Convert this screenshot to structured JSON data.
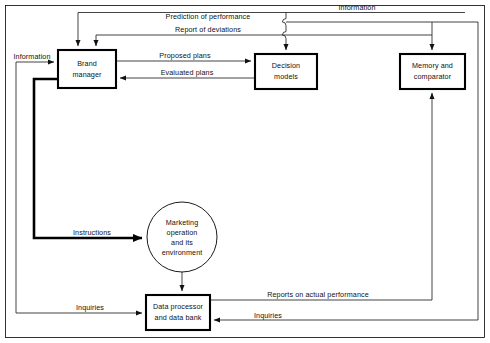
{
  "diagram": {
    "background_color": "#ffffff",
    "line_color": "#222222",
    "nodes": [
      {
        "id": "brand-manager",
        "label_line1": "Brand",
        "label_line2": "manager",
        "shape": "rect",
        "x": 58,
        "y": 50,
        "w": 58,
        "h": 38
      },
      {
        "id": "decision-models",
        "label_line1": "Decision",
        "label_line2": "models",
        "shape": "rect",
        "x": 255,
        "y": 54,
        "w": 62,
        "h": 35
      },
      {
        "id": "memory-comparator",
        "label_line1": "Memory and",
        "label_line2": "comparator",
        "shape": "rect",
        "x": 400,
        "y": 54,
        "w": 65,
        "h": 35
      },
      {
        "id": "data-processor",
        "label_line1": "Data processor",
        "label_line2": "and data bank",
        "shape": "rect",
        "x": 146,
        "y": 295,
        "w": 64,
        "h": 35
      },
      {
        "id": "marketing-operation",
        "label_line1": "Marketing",
        "label_line2": "operation",
        "label_line3": "and its",
        "label_line4": "environment",
        "shape": "circle",
        "cx": 182,
        "cy": 237,
        "r": 35
      }
    ],
    "edges": [
      {
        "id": "prediction-of-performance",
        "label": "Prediction of performance",
        "weight": "thin"
      },
      {
        "id": "report-of-deviations",
        "label": "Report of deviations",
        "weight": "thin"
      },
      {
        "id": "information-top",
        "label": "Information",
        "weight": "thin"
      },
      {
        "id": "proposed-plans",
        "label": "Proposed plans",
        "weight": "thin"
      },
      {
        "id": "evaluated-plans",
        "label": "Evaluated plans",
        "weight": "thin"
      },
      {
        "id": "information-left",
        "label": "Information",
        "weight": "thin"
      },
      {
        "id": "instructions",
        "label": "Instructions",
        "weight": "thick"
      },
      {
        "id": "inquiries-left",
        "label": "Inquiries",
        "weight": "thin"
      },
      {
        "id": "inquiries-right",
        "label": "Inquiries",
        "weight": "thin"
      },
      {
        "id": "reports-on-actual-performance",
        "label": "Reports on actual performance",
        "weight": "thin"
      }
    ]
  }
}
